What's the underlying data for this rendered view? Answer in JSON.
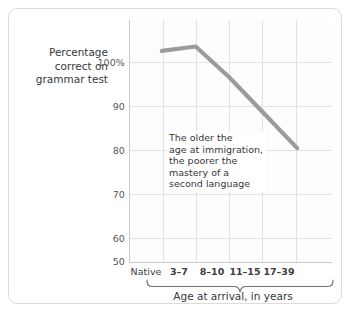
{
  "chart_data": {
    "type": "line",
    "title": "",
    "subtitle": "",
    "xlabel": "Age at arrival, in years",
    "ylabel": "Percentage correct on grammar test",
    "ylabel_lines": [
      "Percentage",
      "correct on",
      "grammar test"
    ],
    "categories": [
      "Native",
      "3–7",
      "8–10",
      "11–15",
      "17–39"
    ],
    "values": [
      98,
      99,
      92,
      84,
      76
    ],
    "series": [
      {
        "name": "Percentage correct on grammar test",
        "values": [
          98,
          99,
          92,
          84,
          76
        ],
        "color": "#9b9b9b"
      }
    ],
    "ylim": [
      50,
      105
    ],
    "yticks": [
      50,
      60,
      70,
      80,
      90,
      100
    ],
    "ytick_labels": [
      "50",
      "60",
      "70",
      "80",
      "90",
      "100%"
    ],
    "grid": true,
    "legend": "none",
    "annotations": [
      {
        "text_lines": [
          "The older the",
          "age at immigration,",
          "the poorer the",
          "mastery of a",
          "second language"
        ],
        "x_category": "8–10",
        "y_value": 79
      }
    ],
    "brace": {
      "covers": [
        "3–7",
        "8–10",
        "11–15",
        "17–39"
      ],
      "label": "Age at arrival, in years"
    }
  },
  "colors": {
    "line": "#9b9b9b",
    "grid": "#e2e2e2",
    "axis": "#c9c9c9",
    "text": "#35383b",
    "tick_text": "#53565a",
    "card_border": "#dcdcdc",
    "background": "#ffffff"
  },
  "axis": {
    "y_tick_0": "100%",
    "y_tick_1": "90",
    "y_tick_2": "80",
    "y_tick_3": "70",
    "y_tick_4": "60",
    "y_tick_5": "50"
  },
  "xaxis": {
    "cat_0": "Native",
    "cat_1": "3–7",
    "cat_2": "8–10",
    "cat_3": "11–15",
    "cat_4": "17–39",
    "title": "Age at arrival, in years"
  },
  "ylabel": {
    "line_0": "Percentage",
    "line_1": "correct on",
    "line_2": "grammar test"
  },
  "annotation": {
    "line_0": "The older the",
    "line_1": "age at immigration,",
    "line_2": "the poorer the",
    "line_3": "mastery of a",
    "line_4": "second language"
  }
}
